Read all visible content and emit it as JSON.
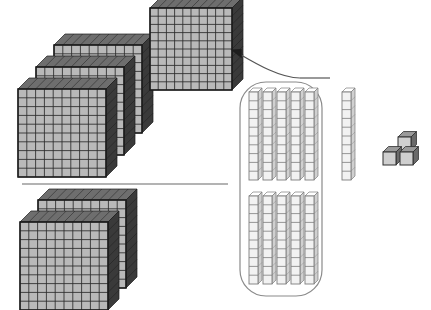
{
  "canvas": {
    "width": 431,
    "height": 310,
    "background": "#ffffff"
  },
  "colors": {
    "flat_face": "#b9b9b9",
    "flat_grid": "#2b2b2b",
    "flat_side": "#3a3a3a",
    "flat_top": "#6e6e6e",
    "flat_outline": "#1c1c1c",
    "rod_face": "#f2f2f2",
    "rod_line": "#7d7d7d",
    "rod_side": "#d0d0d0",
    "cube_face": "#cfcfcf",
    "cube_side": "#6a6a6a",
    "cube_outline": "#2f2f2f",
    "group_outline": "#8a8a8a",
    "arrow": "#555555",
    "divider": "#9a9a9a"
  },
  "diagram": {
    "units": {
      "flat_label": "hundred-flat",
      "flat_value": 100,
      "rod_label": "ten-rod",
      "rod_value": 10,
      "cube_label": "unit-cube",
      "cube_value": 1
    },
    "groups": [
      {
        "name": "minuend-flats",
        "type": "flats",
        "count": 3,
        "value": 300,
        "position": {
          "x": 18,
          "y": 45
        },
        "stagger": {
          "dx": 18,
          "dy": 22
        },
        "flat_size": 88,
        "depth": 11,
        "cells": 10
      },
      {
        "name": "regrouped-flat",
        "type": "flats",
        "count": 1,
        "value": 100,
        "position": {
          "x": 150,
          "y": 8
        },
        "stagger": {
          "dx": 0,
          "dy": 0
        },
        "flat_size": 82,
        "depth": 11,
        "cells": 10
      },
      {
        "name": "subtrahend-flats",
        "type": "flats",
        "count": 2,
        "value": 200,
        "position": {
          "x": 20,
          "y": 200
        },
        "stagger": {
          "dx": 18,
          "dy": 22
        },
        "flat_size": 88,
        "depth": 11,
        "cells": 10
      }
    ],
    "rod_group": {
      "name": "regrouped-tens",
      "outline": {
        "x": 240,
        "y": 82,
        "width": 82,
        "height": 214,
        "radius": 26
      },
      "rows": [
        {
          "name": "rods-row-top",
          "count": 5,
          "x": 249,
          "y": 92,
          "gap": 14,
          "height": 88,
          "segments": 10
        },
        {
          "name": "rods-row-bottom",
          "count": 5,
          "x": 249,
          "y": 196,
          "gap": 14,
          "height": 88,
          "segments": 10
        }
      ],
      "outside_rod": {
        "name": "extra-ten-rod",
        "x": 342,
        "y": 92,
        "height": 88,
        "segments": 10
      },
      "total_inside": 10,
      "total_outside": 1
    },
    "cubes": {
      "name": "unit-cubes",
      "count": 3,
      "size": 13,
      "positions": [
        {
          "x": 398,
          "y": 137
        },
        {
          "x": 383,
          "y": 152
        },
        {
          "x": 400,
          "y": 152
        }
      ]
    },
    "arrow": {
      "name": "regroup-arrow",
      "path": "M 300 78 C 278 78 250 60 236 52",
      "head": {
        "x": 232,
        "y": 50,
        "angle": 205
      },
      "tail": "M 300 78 L 330 78"
    },
    "divider": {
      "name": "operation-divider-line",
      "x1": 22,
      "y1": 184,
      "x2": 228,
      "y2": 184
    }
  }
}
